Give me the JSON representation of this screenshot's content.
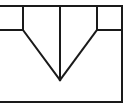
{
  "diagram": {
    "width": 127,
    "height": 107,
    "background": "#ffffff",
    "stroke_color": "#1a1a1a",
    "stroke_width": 2,
    "lines": [
      {
        "name": "top-edge",
        "x1": 0,
        "y1": 6,
        "x2": 122,
        "y2": 6
      },
      {
        "name": "right-edge",
        "x1": 122,
        "y1": 6,
        "x2": 122,
        "y2": 102
      },
      {
        "name": "bottom-edge",
        "x1": 0,
        "y1": 102,
        "x2": 122,
        "y2": 102
      },
      {
        "name": "left-box-vertical",
        "x1": 23,
        "y1": 6,
        "x2": 23,
        "y2": 30
      },
      {
        "name": "left-box-horizontal",
        "x1": 0,
        "y1": 30,
        "x2": 23,
        "y2": 30
      },
      {
        "name": "right-box-vertical",
        "x1": 97,
        "y1": 6,
        "x2": 97,
        "y2": 30
      },
      {
        "name": "right-box-horizontal",
        "x1": 97,
        "y1": 30,
        "x2": 122,
        "y2": 30
      },
      {
        "name": "left-diagonal",
        "x1": 23,
        "y1": 30,
        "x2": 60,
        "y2": 80
      },
      {
        "name": "right-diagonal",
        "x1": 97,
        "y1": 30,
        "x2": 60,
        "y2": 80
      },
      {
        "name": "center-vertical",
        "x1": 60,
        "y1": 6,
        "x2": 60,
        "y2": 80
      }
    ]
  }
}
